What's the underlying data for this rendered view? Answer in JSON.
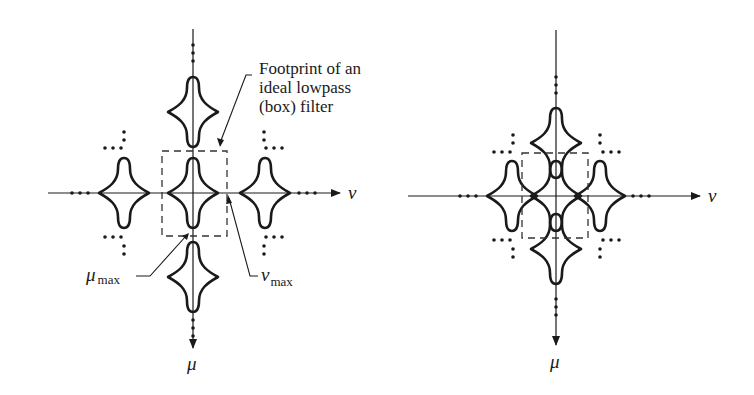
{
  "figure": {
    "left_panel": {
      "axis_labels": {
        "horizontal": "ν",
        "vertical": "μ"
      },
      "callout": {
        "line1": "Footprint of an",
        "line2": "ideal lowpass",
        "line3": "(box) filter"
      },
      "mu_max": {
        "symbol": "μ",
        "subscript": "max"
      },
      "nu_max": {
        "symbol": "ν",
        "subscript": "max"
      },
      "description": "Non-overlapping periods of the spectrum of a sampled function; ideal lowpass box filter isolates central period"
    },
    "right_panel": {
      "axis_labels": {
        "horizontal": "ν",
        "vertical": "μ"
      },
      "description": "Overlapping (aliased) periods of the spectrum; box filter footprint contains contributions from adjacent periods"
    },
    "colors": {
      "ink": "#1a1a1a",
      "background": "#ffffff"
    }
  }
}
